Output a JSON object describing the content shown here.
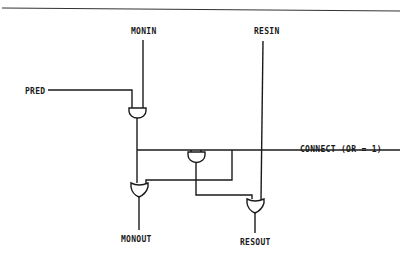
{
  "diagram": {
    "type": "logic-circuit",
    "colors": {
      "ink": "#1a1a1a",
      "background": "#ffffff",
      "rule": "#333333"
    },
    "labels": {
      "monin": "MONIN",
      "resin": "RESIN",
      "pred": "PRED",
      "connect": "CONNECT (OR = 1)",
      "monout": "MONOUT",
      "resout": "RESOUT"
    },
    "gates": [
      {
        "id": "and-pred-monin",
        "kind": "AND",
        "inputs": [
          "PRED",
          "MONIN"
        ]
      },
      {
        "id": "and-connect",
        "kind": "AND",
        "inputs": [
          "and-pred-monin",
          "CONNECT"
        ]
      },
      {
        "id": "or-monout",
        "kind": "OR",
        "inputs": [
          "and-pred-monin",
          "CONNECT"
        ],
        "output": "MONOUT"
      },
      {
        "id": "or-resout",
        "kind": "OR",
        "inputs": [
          "and-connect",
          "RESIN"
        ],
        "output": "RESOUT"
      }
    ]
  }
}
